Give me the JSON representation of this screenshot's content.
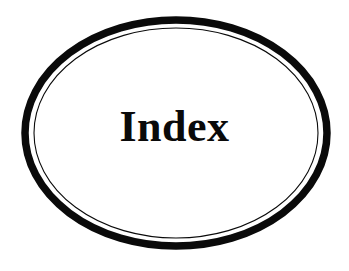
{
  "page": {
    "background_color": "#ffffff",
    "width": 349,
    "height": 271,
    "kind": "book-section-divider-plate"
  },
  "title": {
    "text": "Index",
    "color": "#0a0a0a",
    "style": "bold-serif",
    "center_x": 176,
    "baseline_y": 152
  },
  "ellipse_frame": {
    "name": "double-ruled-oval-border",
    "center_x": 176,
    "center_y": 133,
    "outer_ring": {
      "name": "outer-thick-oval",
      "color": "#0a0a0a",
      "stroke_width": 7.5,
      "radius_x": 151,
      "radius_y": 113
    },
    "inner_ring": {
      "name": "inner-thin-oval",
      "color": "#0a0a0a",
      "stroke_width": 1.1,
      "radius_x": 142,
      "radius_y": 105
    },
    "gap_color": "#ffffff"
  }
}
